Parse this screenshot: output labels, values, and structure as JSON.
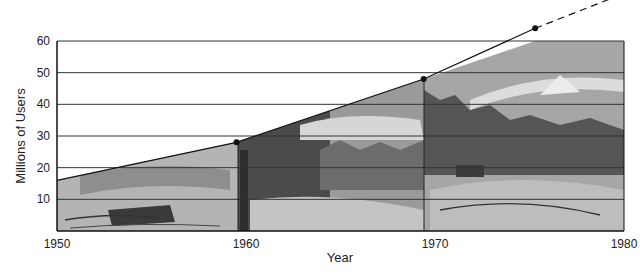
{
  "chart_data": {
    "type": "line",
    "title": "",
    "xlabel": "Year",
    "ylabel": "Millions of Users",
    "xlim": [
      1950,
      1980
    ],
    "ylim": [
      0,
      60
    ],
    "x_ticks": [
      "1950",
      "1960",
      "1970",
      "1980"
    ],
    "y_ticks": [
      "10",
      "20",
      "30",
      "40",
      "50",
      "60"
    ],
    "grid": {
      "horizontal": true,
      "vertical": false
    },
    "legend": null,
    "series": [
      {
        "name": "Users",
        "style": "solid",
        "x": [
          1950,
          1959.5,
          1969.4,
          1975.3
        ],
        "y": [
          16,
          28,
          48,
          64
        ]
      },
      {
        "name": "Projection",
        "style": "dashed",
        "x": [
          1975.3,
          1980
        ],
        "y": [
          64,
          75
        ]
      }
    ],
    "markers": [
      {
        "x": 1959.5,
        "y": 28
      },
      {
        "x": 1969.4,
        "y": 48
      },
      {
        "x": 1975.3,
        "y": 64
      }
    ],
    "annotations": [
      "Area under curve filled with grayscale illustrated landscape panels (boating 1950-1960, fishing 1960-1970, mountains/river 1970-1980)"
    ]
  },
  "colors": {
    "line": "#111111",
    "grid": "#333333",
    "fill_light": "#b8b8b8",
    "fill_mid": "#8a8a8a",
    "fill_dark": "#4a4a4a"
  }
}
